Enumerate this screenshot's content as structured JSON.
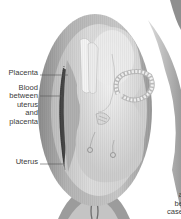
{
  "figure": {
    "labels": [
      {
        "id": "placenta",
        "text": "Placenta"
      },
      {
        "id": "blood",
        "text": "Blood between uterus and placenta",
        "lines": [
          "Blood",
          "between",
          "uterus",
          "and",
          "placenta"
        ]
      },
      {
        "id": "uterus",
        "text": "Uterus"
      }
    ],
    "cut_text_lines": [
      "a",
      "be",
      "case"
    ],
    "colors": {
      "background": "#ffffff",
      "uterus_wall": "#9a9a9a",
      "uterus_inner": "#cfcfcf",
      "fetus": "#e6e6e6",
      "blood_clot": "#4a4a4a",
      "label_text": "#3a3a3a",
      "leader_line": "#555555"
    }
  }
}
